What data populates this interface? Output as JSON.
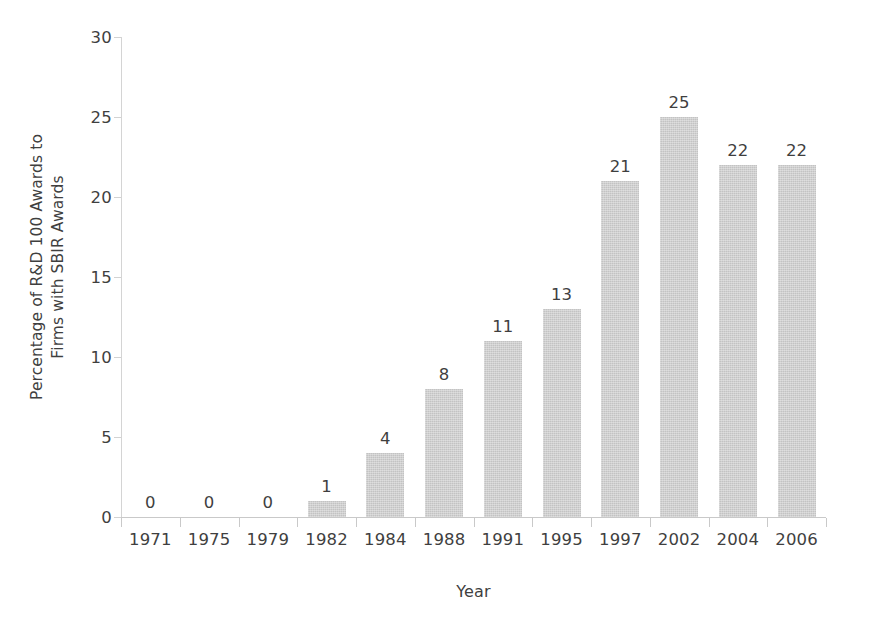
{
  "chart_data": {
    "type": "bar",
    "title": "",
    "subtitle": "",
    "xlabel": "Year",
    "ylabel": "Percentage of R&D 100 Awards to\nFirms with SBIR Awards",
    "categories": [
      "1971",
      "1975",
      "1979",
      "1982",
      "1984",
      "1988",
      "1991",
      "1995",
      "1997",
      "2002",
      "2004",
      "2006"
    ],
    "values": [
      0,
      0,
      0,
      1,
      4,
      8,
      11,
      13,
      21,
      25,
      22,
      22
    ],
    "data_labels": [
      "0",
      "0",
      "0",
      "1",
      "4",
      "8",
      "11",
      "13",
      "21",
      "25",
      "22",
      "22"
    ],
    "ylim": [
      0,
      30
    ],
    "ytick_values": [
      0,
      5,
      10,
      15,
      20,
      25,
      30
    ],
    "ytick_labels": [
      "0",
      "5",
      "10",
      "15",
      "20",
      "25",
      "30"
    ],
    "grid": false,
    "legend": null,
    "legend_position": "none",
    "bar_color": "#c3c3c3",
    "text_color": "#3f3f3f",
    "axis_color": "#c9c9c9",
    "background_color": "#ffffff"
  }
}
